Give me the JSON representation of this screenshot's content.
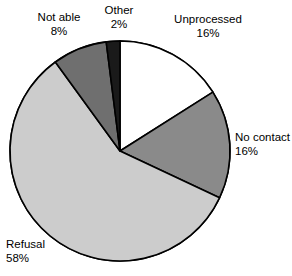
{
  "chart_data": {
    "type": "pie",
    "title": "",
    "subtitle": "",
    "xlabel": "",
    "ylabel": "",
    "legend_position": "none",
    "grid": false,
    "labels_outside": true,
    "start_angle_deg": 0,
    "direction": "clockwise",
    "categories": [
      "Unprocessed",
      "No contact",
      "Refusal",
      "Not able",
      "Other"
    ],
    "values": [
      16,
      16,
      58,
      8,
      2
    ],
    "value_unit": "%",
    "slices": [
      {
        "label": "Unprocessed",
        "value": 16,
        "value_text": "16%",
        "color": "#ffffff",
        "stroke": "#000000"
      },
      {
        "label": "No contact",
        "value": 16,
        "value_text": "16%",
        "color": "#8a8a8a",
        "stroke": "#000000"
      },
      {
        "label": "Refusal",
        "value": 58,
        "value_text": "58%",
        "color": "#cccccc",
        "stroke": "#000000"
      },
      {
        "label": "Not able",
        "value": 8,
        "value_text": "8%",
        "color": "#6f6f6f",
        "stroke": "#000000"
      },
      {
        "label": "Other",
        "value": 2,
        "value_text": "2%",
        "color": "#1a1a1a",
        "stroke": "#000000"
      }
    ]
  },
  "colors": {
    "background": "#ffffff",
    "text": "#000000",
    "outline": "#000000",
    "unprocessed": "#ffffff",
    "no_contact": "#8a8a8a",
    "refusal": "#cccccc",
    "not_able": "#6f6f6f",
    "other": "#1a1a1a"
  }
}
